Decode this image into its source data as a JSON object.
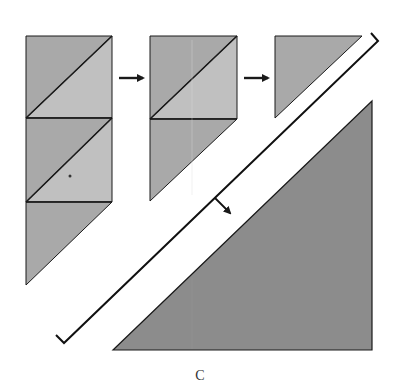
{
  "figure": {
    "label": "C",
    "colors": {
      "background": "#ffffff",
      "dark_patch": "#a9a9a9",
      "light_patch": "#c0c0c0",
      "large_triangle": "#8c8c8c",
      "stroke": "#1a1a1a"
    }
  },
  "steps": [
    {
      "id": "step1",
      "description": "Two half-square-triangle squares stacked above a triangle"
    },
    {
      "id": "step2",
      "description": "One half-square-triangle square above a triangle"
    },
    {
      "id": "step3",
      "description": "Single triangle"
    },
    {
      "id": "result",
      "description": "Large triangle (enlarged view indicated by bracket and arrow)"
    }
  ],
  "arrows": [
    {
      "from": "step1",
      "to": "step2"
    },
    {
      "from": "step2",
      "to": "step3"
    },
    {
      "from": "bracket",
      "to": "result"
    }
  ]
}
